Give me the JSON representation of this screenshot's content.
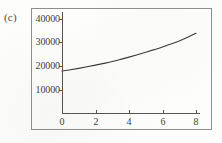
{
  "panel": {
    "label": "(c)"
  },
  "chart_data": {
    "type": "line",
    "title": "",
    "subtitle": "",
    "xlabel": "",
    "ylabel": "",
    "xlim": [
      0,
      8
    ],
    "ylim": [
      0,
      40000
    ],
    "xticks": [
      0,
      2,
      4,
      6,
      8
    ],
    "xtick_labels": [
      "0",
      "2",
      "4",
      "6",
      "8"
    ],
    "yticks": [
      10000,
      20000,
      30000,
      40000
    ],
    "ytick_labels": [
      "10000",
      "20000",
      "30000",
      "40000"
    ],
    "grid": false,
    "legend": false,
    "legend_position": "none",
    "line_color": "#3a3a38",
    "frame_color": "#8e8d8a",
    "series": [
      {
        "name": "curve",
        "x": [
          0,
          0.5,
          1,
          1.5,
          2,
          2.5,
          3,
          3.5,
          4,
          4.5,
          5,
          5.5,
          6,
          6.5,
          7,
          7.5,
          8
        ],
        "values": [
          18000,
          18550,
          19150,
          19800,
          20500,
          21250,
          22050,
          22950,
          23900,
          24900,
          25950,
          27050,
          28200,
          29450,
          30750,
          32300,
          34000
        ]
      }
    ]
  }
}
